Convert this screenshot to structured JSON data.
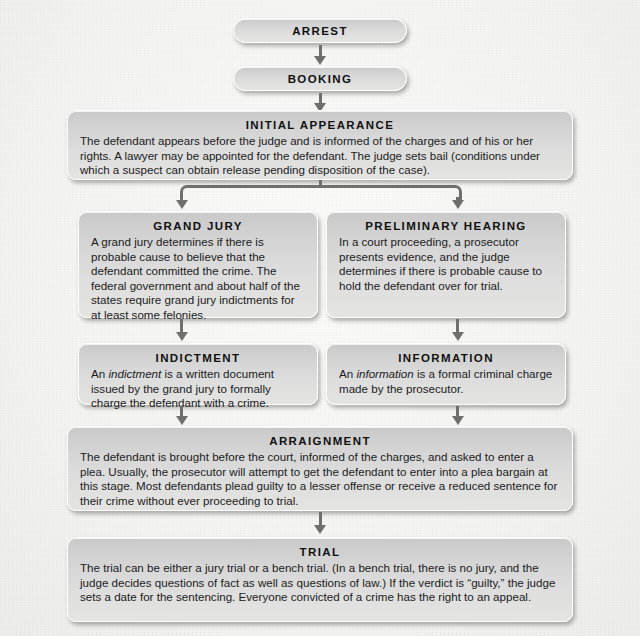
{
  "diagram": {
    "background_color": "#f4f4f2",
    "node_fill_top": "#c9c9c9",
    "node_fill_bottom": "#e4e4e3",
    "connector_color": "#6f6f6f",
    "text_color": "#141414"
  },
  "nodes": {
    "arrest": {
      "title": "ARREST",
      "body": ""
    },
    "booking": {
      "title": "BOOKING",
      "body": ""
    },
    "initial_appearance": {
      "title": "INITIAL APPEARANCE",
      "body": "The defendant appears before the judge and is informed of the charges and of his or her rights. A lawyer may be appointed for the defendant. The judge sets bail (conditions under which a suspect can obtain release pending disposition of the case)."
    },
    "grand_jury": {
      "title": "GRAND JURY",
      "body": "A grand jury determines if there is probable cause to believe that the defendant committed the crime. The federal government and about half of the states require grand jury indictments for at least some felonies."
    },
    "preliminary_hearing": {
      "title": "PRELIMINARY HEARING",
      "body": "In a court proceeding, a prosecutor presents evidence, and the judge determines if there is probable cause to hold the defendant over for trial."
    },
    "indictment": {
      "title": "INDICTMENT",
      "body_pre": "An ",
      "body_em": "indictment",
      "body_post": " is a written document issued by the grand jury to formally charge the defendant with a crime."
    },
    "information": {
      "title": "INFORMATION",
      "body_pre": "An ",
      "body_em": "information",
      "body_post": " is a formal criminal charge made by the prosecutor."
    },
    "arraignment": {
      "title": "ARRAIGNMENT",
      "body": "The defendant is brought before the court, informed of the charges, and asked to enter a plea. Usually, the prosecutor will attempt to get the defendant to enter into a plea bargain at this stage. Most defendants plead guilty to a lesser offense or receive a reduced sentence for their crime without ever proceeding to trial."
    },
    "trial": {
      "title": "TRIAL",
      "body": "The trial can be either a jury trial or a bench trial. (In a bench trial, there is no jury, and the judge decides questions of fact as well as questions of law.) If the verdict is “guilty,” the judge sets a date for the sentencing. Everyone convicted of a crime has the right to an appeal."
    }
  }
}
